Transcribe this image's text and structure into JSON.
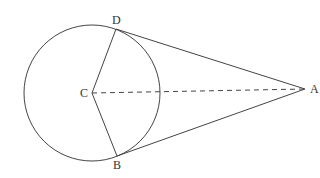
{
  "diagram": {
    "type": "geometry",
    "colors": {
      "stroke": "#444444",
      "label": "#333333",
      "background": "#ffffff"
    },
    "circle": {
      "center_label": "C",
      "cx": 92,
      "cy": 93,
      "r": 68
    },
    "points": [
      {
        "label": "D",
        "x": 116,
        "y": 29,
        "label_x": 112,
        "label_y": 24
      },
      {
        "label": "C",
        "x": 92,
        "y": 93,
        "label_x": 80,
        "label_y": 97
      },
      {
        "label": "B",
        "x": 117,
        "y": 156,
        "label_x": 113,
        "label_y": 169
      },
      {
        "label": "A",
        "x": 305,
        "y": 89,
        "label_x": 310,
        "label_y": 93
      }
    ],
    "segments": [
      {
        "from": "C",
        "to": "D",
        "style": "solid"
      },
      {
        "from": "C",
        "to": "B",
        "style": "solid"
      },
      {
        "from": "D",
        "to": "A",
        "style": "solid",
        "note": "tangent"
      },
      {
        "from": "B",
        "to": "A",
        "style": "solid",
        "note": "tangent"
      },
      {
        "from": "C",
        "to": "A",
        "style": "dashed"
      }
    ]
  },
  "labels": {
    "D": "D",
    "C": "C",
    "B": "B",
    "A": "A"
  }
}
